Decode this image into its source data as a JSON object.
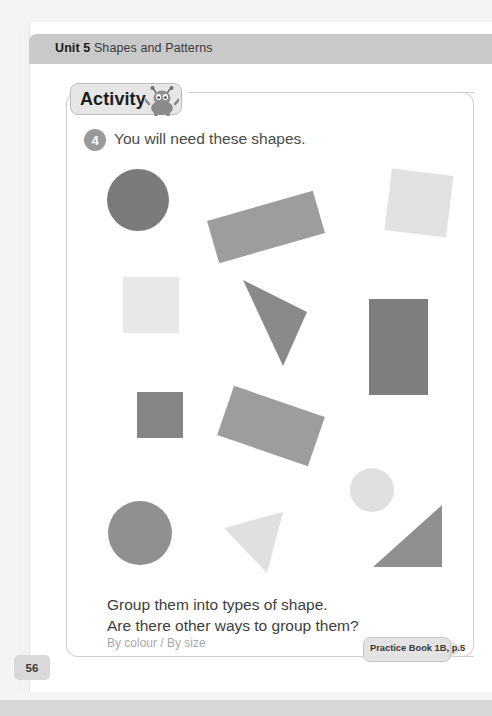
{
  "header": {
    "unit": "Unit 5",
    "title": "Shapes and Patterns"
  },
  "activity": {
    "badge_label": "Activity",
    "mascot_icon": "alien-mascot-icon",
    "question_number": "4",
    "question_text": "You will need these shapes.",
    "prompt_line1": "Group them into types of shape.",
    "prompt_line2": "Are there other ways to group them?",
    "prompt_answer": "By colour / By size"
  },
  "practice_book": {
    "label": "Practice Book 1B, p.5"
  },
  "page_number": "56",
  "colors": {
    "dark_grey": "#7b7b7b",
    "mid_grey": "#9d9d9d",
    "light_grey": "#e2e2e2",
    "header_bar": "#c9c9c9",
    "badge_fill": "#e6e6e6",
    "number_circle": "#9a9a9a"
  },
  "shapes": [
    {
      "name": "circle-dark-top-left",
      "type": "circle",
      "fill": "#7b7b7b",
      "cx": 138,
      "cy": 200,
      "r": 31
    },
    {
      "name": "rectangle-mid-rotated-top",
      "type": "rect",
      "fill": "#9d9d9d",
      "x": 211,
      "y": 205,
      "w": 110,
      "h": 44,
      "rotate": -16
    },
    {
      "name": "square-light-tilted-top-right",
      "type": "rect",
      "fill": "#e2e2e2",
      "x": 388,
      "y": 172,
      "w": 62,
      "h": 62,
      "rotate": 7
    },
    {
      "name": "square-light-middle-left",
      "type": "rect",
      "fill": "#e8e8e8",
      "x": 123,
      "y": 277,
      "w": 56,
      "h": 56,
      "rotate": 0
    },
    {
      "name": "triangle-dark-middle",
      "type": "triangle",
      "fill": "#8a8a8a",
      "points": "243,280 307,312 283,366"
    },
    {
      "name": "rectangle-dark-vertical-right",
      "type": "rect",
      "fill": "#7e7e7e",
      "x": 369,
      "y": 299,
      "w": 59,
      "h": 96,
      "rotate": 0
    },
    {
      "name": "square-dark-lower-left",
      "type": "rect",
      "fill": "#858585",
      "x": 137,
      "y": 392,
      "w": 46,
      "h": 46,
      "rotate": 0
    },
    {
      "name": "rectangle-mid-rotated-lower",
      "type": "rect",
      "fill": "#9d9d9d",
      "x": 223,
      "y": 400,
      "w": 96,
      "h": 52,
      "rotate": 19
    },
    {
      "name": "circle-light-small-right",
      "type": "circle",
      "fill": "#e0e0e0",
      "cx": 372,
      "cy": 490,
      "r": 22
    },
    {
      "name": "circle-mid-bottom-left",
      "type": "circle",
      "fill": "#909090",
      "cx": 140,
      "cy": 533,
      "r": 32
    },
    {
      "name": "triangle-light-bottom",
      "type": "triangle",
      "fill": "#e0e0e0",
      "points": "224,528 283,512 267,573"
    },
    {
      "name": "triangle-mid-bottom-right",
      "type": "triangle",
      "fill": "#8f8f8f",
      "points": "442,505 442,567 373,567"
    }
  ]
}
